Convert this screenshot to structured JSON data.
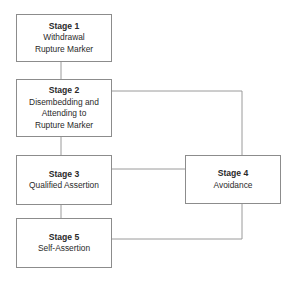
{
  "diagram": {
    "nodes": [
      {
        "id": "stage1",
        "title": "Stage 1",
        "lines": [
          "Withdrawal",
          "Rupture Marker"
        ]
      },
      {
        "id": "stage2",
        "title": "Stage 2",
        "lines": [
          "Disembedding and",
          "Attending to",
          "Rupture Marker"
        ]
      },
      {
        "id": "stage3",
        "title": "Stage 3",
        "lines": [
          "Qualified Assertion"
        ]
      },
      {
        "id": "stage4",
        "title": "Stage 4",
        "lines": [
          "Avoidance"
        ]
      },
      {
        "id": "stage5",
        "title": "Stage 5",
        "lines": [
          "Self-Assertion"
        ]
      }
    ],
    "edges": [
      {
        "from": "stage1",
        "to": "stage2"
      },
      {
        "from": "stage2",
        "to": "stage3"
      },
      {
        "from": "stage3",
        "to": "stage5"
      },
      {
        "from": "stage2",
        "to": "stage4"
      },
      {
        "from": "stage3",
        "to": "stage4"
      },
      {
        "from": "stage4",
        "to": "stage5"
      }
    ],
    "colors": {
      "border": "#8c8c8c",
      "connector": "#9a9a9a",
      "text": "#2a2a2a"
    }
  }
}
